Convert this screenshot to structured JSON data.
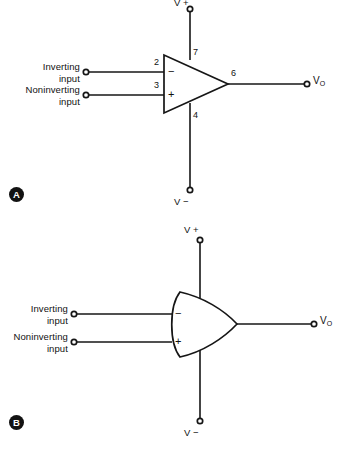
{
  "figure": {
    "background_color": "#ffffff",
    "line_color": "#161616",
    "text_color": "#111111",
    "width": 346,
    "height": 451
  },
  "panel_a": {
    "marker": "A",
    "symbol_style": "triangle",
    "inverting_label_line1": "Inverting",
    "inverting_label_line2": "input",
    "noninverting_label_line1": "Noninverting",
    "noninverting_label_line2": "input",
    "inverting_sign": "−",
    "noninverting_sign": "+",
    "pin_inverting": "2",
    "pin_noninverting": "3",
    "pin_vplus": "7",
    "pin_vminus": "4",
    "pin_output": "6",
    "rail_positive": "V +",
    "rail_negative": "V −",
    "output_label": "V",
    "output_subscript": "O"
  },
  "panel_b": {
    "marker": "B",
    "symbol_style": "curved-back",
    "inverting_label_line1": "Inverting",
    "inverting_label_line2": "input",
    "noninverting_label_line1": "Noninverting",
    "noninverting_label_line2": "input",
    "inverting_sign": "−",
    "noninverting_sign": "+",
    "rail_positive": "V +",
    "rail_negative": "V −",
    "output_label": "V",
    "output_subscript": "O"
  },
  "caption": {
    "partial_text": ""
  }
}
